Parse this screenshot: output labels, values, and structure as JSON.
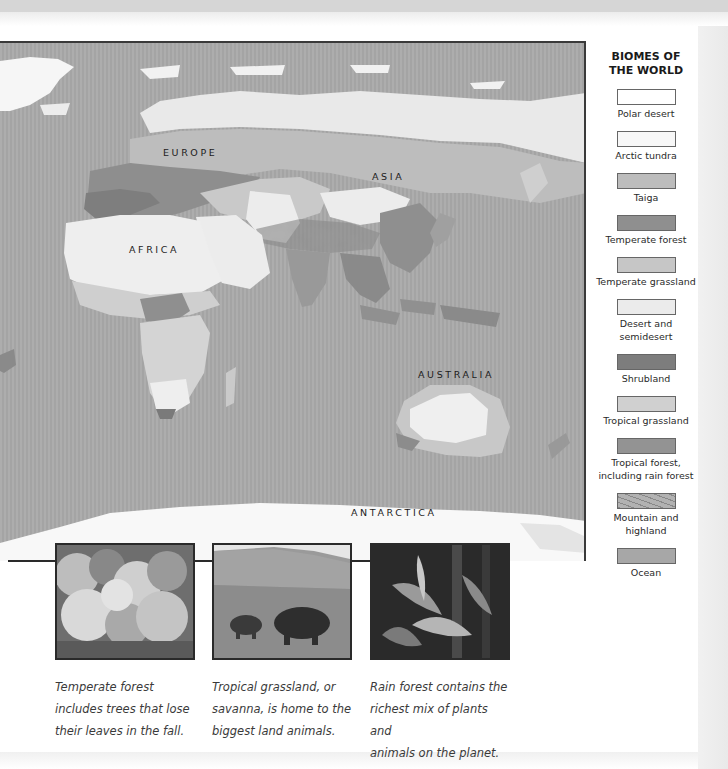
{
  "map": {
    "labels": {
      "europe": "EUROPE",
      "asia": "ASIA",
      "africa": "AFRICA",
      "australia": "AUSTRALIA",
      "antarctica": "ANTARCTICA"
    },
    "colors": {
      "ocean": "#a9a9a9",
      "polar": "#f4f4f4",
      "taiga": "#bdbdbd",
      "temperate_forest": "#8c8c8c",
      "temperate_grassland": "#c4c4c4",
      "desert": "#e6e6e6",
      "shrubland": "#7e7e7e",
      "tropical_grassland": "#cfcfcf",
      "tropical_forest": "#929292"
    }
  },
  "legend": {
    "title_line1": "BIOMES OF",
    "title_line2": "THE WORLD",
    "items": [
      {
        "label1": "Polar desert",
        "label2": "",
        "color": "#ffffff"
      },
      {
        "label1": "Arctic tundra",
        "label2": "",
        "color": "#f7f7f7"
      },
      {
        "label1": "Taiga",
        "label2": "",
        "color": "#bcbcbc"
      },
      {
        "label1": "Temperate forest",
        "label2": "",
        "color": "#8f8f8f"
      },
      {
        "label1": "Temperate grassland",
        "label2": "",
        "color": "#c6c6c6"
      },
      {
        "label1": "Desert and",
        "label2": "semidesert",
        "color": "#ebebeb"
      },
      {
        "label1": "Shrubland",
        "label2": "",
        "color": "#7d7d7d"
      },
      {
        "label1": "Tropical grassland",
        "label2": "",
        "color": "#d0d0d0"
      },
      {
        "label1": "Tropical forest,",
        "label2": "including rain forest",
        "color": "#939393"
      },
      {
        "label1": "Mountain and",
        "label2": "highland",
        "color": "#b2b2b2"
      },
      {
        "label1": "Ocean",
        "label2": "",
        "color": "#a7a7a7"
      }
    ]
  },
  "photos": [
    {
      "subject": "temperate-forest",
      "caption": [
        "Temperate forest",
        "includes trees that lose",
        "their leaves in the fall."
      ]
    },
    {
      "subject": "savanna-elephants",
      "caption": [
        "Tropical grassland, or",
        "savanna, is home to the",
        "biggest land animals."
      ]
    },
    {
      "subject": "rain-forest",
      "caption": [
        "Rain forest contains the",
        "richest mix of plants and",
        "animals on the planet."
      ]
    }
  ]
}
